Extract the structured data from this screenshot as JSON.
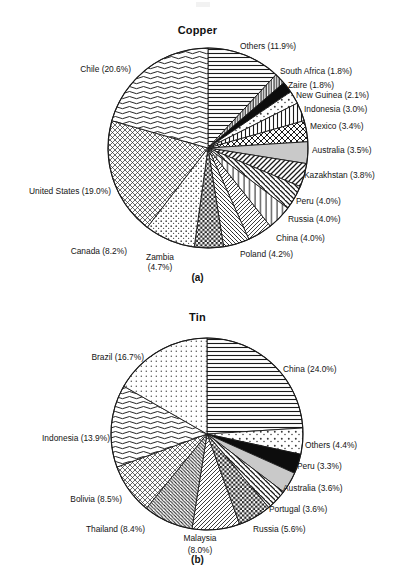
{
  "figure": {
    "width": 395,
    "height": 572,
    "background": "#ffffff",
    "line_color": "#1a1a1a",
    "text_color": "#141414"
  },
  "panels": [
    {
      "key": "copper",
      "title": "Copper",
      "letter": "(a)",
      "center": [
        208,
        148
      ],
      "radius": 100
    },
    {
      "key": "tin",
      "title": "Tin",
      "letter": "(b)",
      "center": [
        207,
        434
      ],
      "radius": 96
    }
  ],
  "chart_data": [
    {
      "type": "pie",
      "title": "Copper",
      "subtitle": "(a)",
      "xlabel": "",
      "ylabel": "",
      "units": "percent",
      "legend": "labels-outside-with-leader-text",
      "start_angle_deg": -90,
      "direction": "clockwise",
      "categories": [
        "Others",
        "South Africa",
        "Zaire",
        "New Guinea",
        "Indonesia",
        "Mexico",
        "Australia",
        "Kazakhstan",
        "Peru",
        "Russia",
        "China",
        "Poland",
        "Zambia",
        "Canada",
        "United States",
        "Chile"
      ],
      "values": [
        11.9,
        1.8,
        1.8,
        2.1,
        3.0,
        3.4,
        3.5,
        3.8,
        4.0,
        4.0,
        4.0,
        4.2,
        4.7,
        8.2,
        19.0,
        20.6
      ],
      "labels": [
        "Others (11.9%)",
        "South Africa (1.8%)",
        "Zaire (1.8%)",
        "New Guinea (2.1%)",
        "Indonesia (3.0%)",
        "Mexico (3.4%)",
        "Australia (3.5%)",
        "Kazakhstan (3.8%)",
        "Peru (4.0%)",
        "Russia (4.0%)",
        "China (4.0%)",
        "Poland (4.2%)",
        "Zambia (4.7%)",
        "Canada (8.2%)",
        "United States (19.0%)",
        "Chile (20.6%)"
      ],
      "patterns": [
        "horizontal-lines",
        "vertical-lines-dense",
        "solid-black",
        "sparse-dots",
        "vertical-lines",
        "cross-hatch-diamond",
        "solid-gray",
        "diagonal-hatch-left",
        "diagonal-hatch-right",
        "vertical-lines-wide",
        "diagonal-hatch-left-fine",
        "diagonal-hatch-right-fine",
        "checkerboard-dark",
        "speckle-dots",
        "cross-hatch-fine",
        "wavy-horizontal-lines",
        "fine-dots"
      ]
    },
    {
      "type": "pie",
      "title": "Tin",
      "subtitle": "(b)",
      "xlabel": "",
      "ylabel": "",
      "units": "percent",
      "legend": "labels-outside-with-leader-text",
      "start_angle_deg": -90,
      "direction": "clockwise",
      "categories": [
        "China",
        "Others",
        "Peru",
        "Australia",
        "Portugal",
        "Russia",
        "Malaysia",
        "Thailand",
        "Bolivia",
        "Indonesia",
        "Brazil"
      ],
      "values": [
        24.0,
        4.4,
        3.3,
        3.6,
        3.6,
        5.6,
        8.0,
        8.4,
        8.5,
        13.9,
        16.7
      ],
      "labels": [
        "China (24.0%)",
        "Others (4.4%)",
        "Peru (3.3%)",
        "Australia (3.6%)",
        "Portugal (3.6%)",
        "Russia (5.6%)",
        "Malaysia (8.0%)",
        "Thailand (8.4%)",
        "Bolivia (8.5%)",
        "Indonesia (13.9%)",
        "Brazil (16.7%)"
      ],
      "patterns": [
        "horizontal-lines",
        "sparse-dots",
        "solid-black",
        "solid-gray",
        "diagonal-hatch-right",
        "checkerboard-dark",
        "diagonal-hatch-left-fine",
        "diagonal-hatch-right-dense",
        "cross-hatch-fine",
        "wavy-horizontal-lines",
        "fine-dots"
      ]
    }
  ],
  "copper_labels": [
    {
      "text": "Others (11.9%)",
      "x": 240,
      "y": 41,
      "align": "left"
    },
    {
      "text": "South Africa (1.8%)",
      "x": 280,
      "y": 66,
      "align": "left"
    },
    {
      "text": "Zaire (1.8%)",
      "x": 288,
      "y": 80,
      "align": "left"
    },
    {
      "text": "New Guinea (2.1%)",
      "x": 296,
      "y": 90,
      "align": "left"
    },
    {
      "text": "Indonesia (3.0%)",
      "x": 304,
      "y": 104,
      "align": "left"
    },
    {
      "text": "Mexico (3.4%)",
      "x": 310,
      "y": 121,
      "align": "left"
    },
    {
      "text": "Australia (3.5%)",
      "x": 312,
      "y": 145,
      "align": "left"
    },
    {
      "text": "Kazakhstan (3.8%)",
      "x": 304,
      "y": 170,
      "align": "left"
    },
    {
      "text": "Peru (4.0%)",
      "x": 296,
      "y": 196,
      "align": "left"
    },
    {
      "text": "Russia (4.0%)",
      "x": 288,
      "y": 214,
      "align": "left"
    },
    {
      "text": "China (4.0%)",
      "x": 276,
      "y": 233,
      "align": "left"
    },
    {
      "text": "Poland (4.2%)",
      "x": 240,
      "y": 249,
      "align": "left"
    },
    {
      "text": "Zambia",
      "x": 160,
      "y": 252,
      "align": "center"
    },
    {
      "text": "(4.7%)",
      "x": 160,
      "y": 262,
      "align": "center"
    },
    {
      "text": "Canada (8.2%)",
      "x": 127,
      "y": 246,
      "align": "right"
    },
    {
      "text": "United States (19.0%)",
      "x": 111,
      "y": 186,
      "align": "right"
    },
    {
      "text": "Chile (20.6%)",
      "x": 131,
      "y": 64,
      "align": "right"
    }
  ],
  "tin_labels": [
    {
      "text": "China (24.0%)",
      "x": 283,
      "y": 364,
      "align": "left"
    },
    {
      "text": "Others (4.4%)",
      "x": 305,
      "y": 440,
      "align": "left"
    },
    {
      "text": "Peru (3.3%)",
      "x": 297,
      "y": 461,
      "align": "left"
    },
    {
      "text": "Australia (3.6%)",
      "x": 283,
      "y": 483,
      "align": "left"
    },
    {
      "text": "Portugal (3.6%)",
      "x": 269,
      "y": 504,
      "align": "left"
    },
    {
      "text": "Russia (5.6%)",
      "x": 253,
      "y": 524,
      "align": "left"
    },
    {
      "text": "Malaysia",
      "x": 200,
      "y": 533,
      "align": "center"
    },
    {
      "text": "(8.0%)",
      "x": 200,
      "y": 545,
      "align": "center"
    },
    {
      "text": "Thailand (8.4%)",
      "x": 145,
      "y": 524,
      "align": "right"
    },
    {
      "text": "Bolivia (8.5%)",
      "x": 122,
      "y": 494,
      "align": "right"
    },
    {
      "text": "Indonesia (13.9%)",
      "x": 110,
      "y": 433,
      "align": "right"
    },
    {
      "text": "Brazil (16.7%)",
      "x": 144,
      "y": 352,
      "align": "right"
    }
  ]
}
